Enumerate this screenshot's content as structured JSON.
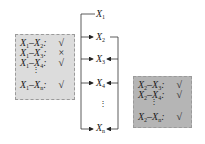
{
  "left_box": {
    "fill": "#dcdcdc",
    "rows": [
      {
        "a": "X",
        "a_sub": "1",
        "b": "X",
        "b_sub": "2",
        "mark": "√"
      },
      {
        "a": "X",
        "a_sub": "1",
        "b": "X",
        "b_sub": "3",
        "mark": "×"
      },
      {
        "a": "X",
        "a_sub": "1",
        "b": "X",
        "b_sub": "4",
        "mark": "√"
      },
      {
        "a": "X",
        "a_sub": "1",
        "b": "X",
        "b_sub": "n",
        "mark": "√"
      }
    ],
    "ellipsis": "⋮"
  },
  "right_box": {
    "fill": "#b5b5b5",
    "rows": [
      {
        "a": "X",
        "a_sub": "2",
        "b": "X",
        "b_sub": "3",
        "mark": "√"
      },
      {
        "a": "X",
        "a_sub": "2",
        "b": "X",
        "b_sub": "4",
        "mark": "√"
      },
      {
        "a": "X",
        "a_sub": "2",
        "b": "X",
        "b_sub": "n",
        "mark": "√"
      }
    ],
    "ellipsis": "⋮"
  },
  "nodes": [
    {
      "name": "X",
      "sub": "1"
    },
    {
      "name": "X",
      "sub": "2"
    },
    {
      "name": "X",
      "sub": "3"
    },
    {
      "name": "X",
      "sub": "4"
    },
    {
      "name": "X",
      "sub": "n"
    }
  ],
  "center_ellipsis": "⋮",
  "separator": "–",
  "colon": ":"
}
